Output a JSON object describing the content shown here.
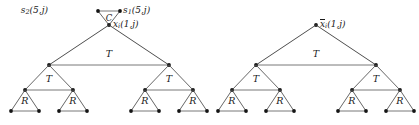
{
  "figure": {
    "type": "tree-diagram",
    "labels": {
      "top_left_node": "s₂(5,j)",
      "top_right_node": "s₁(5,j)",
      "connector_triangle": "C",
      "left_root": "xᵢ(1,j)",
      "right_root": "x̄ᵢ(1,j)",
      "level1_triangle": "T",
      "level2_triangle": "T",
      "level3_triangle": "R"
    },
    "label_parts": {
      "s2_base": "s",
      "s2_sub": "2",
      "s2_args": "(5,j)",
      "s1_base": "s",
      "s1_sub": "1",
      "s1_args": "(5,j)",
      "x_base": "x",
      "x_sub": "i",
      "x_args": "(1,j)",
      "xbar_base": "x",
      "xbar_sub": "i",
      "xbar_args": "(1,j)"
    },
    "trees": [
      {
        "name": "left-tree",
        "root_label": "xᵢ(1,j)",
        "levels": [
          {
            "label": "T",
            "count": 1
          },
          {
            "label": "T",
            "count": 2
          },
          {
            "label": "R",
            "count": 4
          }
        ]
      },
      {
        "name": "right-tree",
        "root_label": "x̄ᵢ(1,j)",
        "levels": [
          {
            "label": "T",
            "count": 1
          },
          {
            "label": "T",
            "count": 2
          },
          {
            "label": "R",
            "count": 4
          }
        ]
      }
    ],
    "colors": {
      "ink": "#1a1a1a",
      "edge": "#3a3a3a",
      "edge_light": "#6a6a6a",
      "background": "#ffffff"
    }
  }
}
